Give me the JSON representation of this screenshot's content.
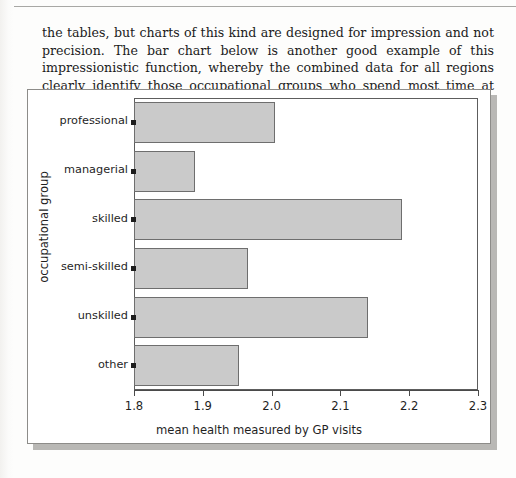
{
  "page": {
    "paragraph": "the tables, but charts of this kind are designed for impression and not precision. The bar chart below is another good example of this impressionistic function, whereby the combined data for all regions clearly identify those occupational groups who spend most time at their doctors."
  },
  "chart_data": {
    "type": "bar",
    "orientation": "horizontal",
    "title": "",
    "categories": [
      "professional",
      "managerial",
      "skilled",
      "semi-skilled",
      "unskilled",
      "other"
    ],
    "values": [
      2.005,
      1.888,
      2.19,
      1.965,
      2.14,
      1.952
    ],
    "xlabel": "mean health measured by GP visits",
    "ylabel": "occupational group",
    "xlim": [
      1.8,
      2.3
    ],
    "xticks": [
      "1.8",
      "1.9",
      "2.0",
      "2.1",
      "2.2",
      "2.3"
    ],
    "xtick_values": [
      1.8,
      1.9,
      2.0,
      2.1,
      2.2,
      2.3
    ],
    "grid": false,
    "legend": false,
    "bar_fill_color": "#cacaca",
    "bar_edge_color": "#6e6e6e",
    "frame_color": "#5d5d5d",
    "background": "#ffffff"
  }
}
